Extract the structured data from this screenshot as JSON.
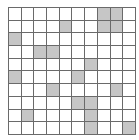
{
  "grid": {
    "rows": 10,
    "cols": 10,
    "line_color": "#6a6a6a",
    "empty_color": "#ffffff",
    "shaded_color": "#c6c6c6",
    "shaded_cells": [
      [
        0,
        7
      ],
      [
        0,
        8
      ],
      [
        1,
        4
      ],
      [
        1,
        7
      ],
      [
        1,
        8
      ],
      [
        2,
        0
      ],
      [
        3,
        2
      ],
      [
        3,
        3
      ],
      [
        4,
        6
      ],
      [
        5,
        0
      ],
      [
        5,
        5
      ],
      [
        6,
        3
      ],
      [
        6,
        8
      ],
      [
        7,
        5
      ],
      [
        7,
        6
      ],
      [
        8,
        1
      ],
      [
        8,
        6
      ],
      [
        9,
        6
      ],
      [
        9,
        9
      ]
    ]
  }
}
